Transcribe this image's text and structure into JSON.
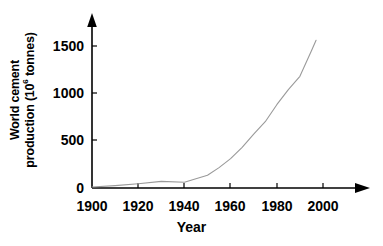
{
  "chart_data": {
    "type": "line",
    "title": "",
    "xlabel": "Year",
    "ylabel_line1": "World cement",
    "ylabel_line2_pre": "production (10",
    "ylabel_exponent": "6",
    "ylabel_line2_post": " tonnes)",
    "ylabel_full": "World cement production (10⁶ tonnes)",
    "xlim": [
      1900,
      2000
    ],
    "ylim": [
      0,
      1600
    ],
    "xticks": [
      1900,
      1920,
      1940,
      1960,
      1980,
      2000
    ],
    "xtick_labels": [
      "1900",
      "1920",
      "1940",
      "1960",
      "1980",
      "2000"
    ],
    "yticks": [
      0,
      500,
      1000,
      1500
    ],
    "ytick_labels": [
      "0",
      "500",
      "1000",
      "1500"
    ],
    "grid": false,
    "legend": false,
    "line_color": "#9a9a9a",
    "axis_color": "#000000",
    "series": [
      {
        "name": "World cement production",
        "x": [
          1900,
          1910,
          1920,
          1930,
          1940,
          1950,
          1955,
          1960,
          1965,
          1970,
          1975,
          1980,
          1985,
          1990,
          1995,
          1997
        ],
        "values": [
          10,
          25,
          45,
          70,
          60,
          135,
          215,
          310,
          430,
          570,
          700,
          880,
          1040,
          1180,
          1450,
          1560
        ]
      }
    ]
  },
  "axes": {
    "y_arrow": "up-arrow-icon",
    "x_arrow": "right-arrow-icon"
  }
}
